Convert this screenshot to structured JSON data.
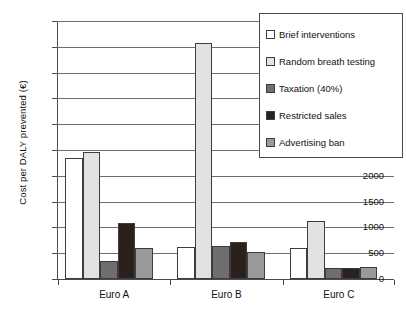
{
  "chart_data": {
    "type": "bar",
    "title": "",
    "subtitle": "",
    "xlabel": "",
    "ylabel": "Cost per DALY prevented (€)",
    "categories": [
      "Euro A",
      "Euro B",
      "Euro C"
    ],
    "series": [
      {
        "name": "Brief interventions",
        "color": "#ffffff",
        "values": [
          2350,
          620,
          610
        ]
      },
      {
        "name": "Random breath testing",
        "color": "#e2e2e2",
        "values": [
          2470,
          4570,
          1120
        ]
      },
      {
        "name": "Taxation (40%)",
        "color": "#6e6e6e",
        "values": [
          340,
          635,
          205
        ]
      },
      {
        "name": "Restricted sales",
        "color": "#2b201c",
        "values": [
          1090,
          715,
          220
        ]
      },
      {
        "name": "Advertising ban",
        "color": "#9a9a9a",
        "values": [
          600,
          525,
          240
        ]
      }
    ],
    "ylim": [
      0,
      5000
    ],
    "ytick_labels": [
      "5000",
      "4500",
      "4000",
      "3500",
      "3000",
      "2500",
      "2000",
      "1500",
      "1000",
      "500",
      "0"
    ],
    "ytick_values": [
      5000,
      4500,
      4000,
      3500,
      3000,
      2500,
      2000,
      1500,
      1000,
      500,
      0
    ],
    "grid": true,
    "grid_axis": "y",
    "legend_position": "top-right",
    "bar_border_color": "#3d3d3d",
    "axis_color": "#4a4a4a",
    "grid_color": "#6e6e6e"
  }
}
